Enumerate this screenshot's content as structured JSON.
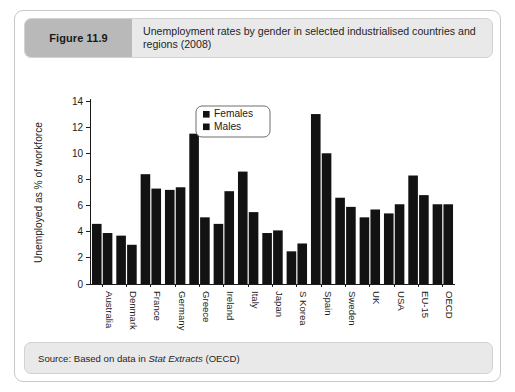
{
  "figure": {
    "badge": "Figure 11.9",
    "title": "Unemployment rates by gender in selected industrialised countries and regions (2008)",
    "source_prefix": "Source: Based on data in ",
    "source_italic": "Stat Extracts",
    "source_suffix": " (OECD)"
  },
  "chart_data": {
    "type": "bar",
    "title": "Unemployment rates by gender in selected industrialised countries and regions (2008)",
    "xlabel": "",
    "ylabel": "Unemployed as % of workforce",
    "ylim": [
      0,
      14
    ],
    "yticks": [
      0,
      2,
      4,
      6,
      8,
      10,
      12,
      14
    ],
    "grid": false,
    "legend_position": "top-center",
    "categories": [
      "Australia",
      "Denmark",
      "France",
      "Germany",
      "Greece",
      "Ireland",
      "Italy",
      "Japan",
      "S Korea",
      "Spain",
      "Sweden",
      "UK",
      "USA",
      "EU-15",
      "OECD"
    ],
    "series": [
      {
        "name": "Females",
        "color": "#121212",
        "values": [
          4.6,
          3.7,
          8.4,
          7.2,
          11.5,
          4.6,
          8.6,
          3.9,
          2.5,
          13.0,
          6.6,
          5.1,
          5.4,
          8.3,
          6.1
        ]
      },
      {
        "name": "Males",
        "color": "#121212",
        "values": [
          3.9,
          3.0,
          7.3,
          7.4,
          5.1,
          7.1,
          5.5,
          4.1,
          3.1,
          10.0,
          5.9,
          5.7,
          6.1,
          6.8,
          6.1
        ]
      }
    ]
  }
}
